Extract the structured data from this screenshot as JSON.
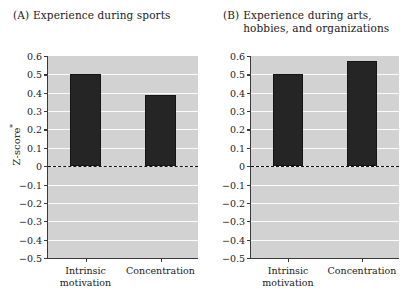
{
  "chart_data": {
    "type": "bar",
    "ylabel": "Z-score*",
    "ylabel_base": "Z-score",
    "ylabel_sup": "*",
    "xlabel": "",
    "ylim": [
      -0.5,
      0.6
    ],
    "ytick_step": 0.1,
    "grid": true,
    "legend": "none",
    "yticks": [
      "0.6",
      "0.5",
      "0.4",
      "0.3",
      "0.2",
      "0.1",
      "0",
      "-0.1",
      "-0.2",
      "-0.3",
      "-0.4",
      "-0.5"
    ],
    "ytick_values": [
      0.6,
      0.5,
      0.4,
      0.3,
      0.2,
      0.1,
      0,
      -0.1,
      -0.2,
      -0.3,
      -0.4,
      -0.5
    ],
    "zero_reference_line": 0,
    "categories": [
      "Intrinsic\nmotivation",
      "Concentration"
    ],
    "panels": [
      {
        "tag": "(A)",
        "title": "Experience during sports",
        "categories": [
          "Intrinsic\nmotivation",
          "Concentration"
        ],
        "values": [
          0.5,
          0.385
        ]
      },
      {
        "tag": "(B)",
        "title": "Experience during arts, hobbies, and organizations",
        "categories": [
          "Intrinsic\nmotivation",
          "Concentration"
        ],
        "values": [
          0.5,
          0.575
        ]
      }
    ],
    "colors": {
      "bar": "#252525",
      "plot_background": "#d2d2d2",
      "gridline": "#fbfbfb",
      "axis": "#3a3a3a",
      "zero_line": "#111111",
      "text": "#1a1a1a"
    }
  }
}
